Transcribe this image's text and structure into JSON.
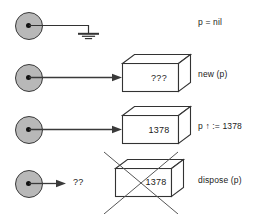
{
  "figure": {
    "background_color": "#ffffff",
    "stroke_color": "#333333",
    "circle_fill": "#b8b8b8",
    "text_color": "#1a1a1a"
  },
  "rows": [
    {
      "id": "nil",
      "pointer_label": "pointer-variable",
      "target": "ground-symbol",
      "target_text": "",
      "code_label": "p = nil",
      "crossed_out": false
    },
    {
      "id": "new",
      "pointer_label": "pointer-variable",
      "target": "box",
      "target_text": "???",
      "code_label": "new (p)",
      "crossed_out": false
    },
    {
      "id": "assign",
      "pointer_label": "pointer-variable",
      "target": "box",
      "target_text": "1378",
      "code_label": "p ↑ := 1378",
      "crossed_out": false
    },
    {
      "id": "dispose",
      "pointer_label": "pointer-variable",
      "target": "box",
      "target_text": "1378",
      "dangling_text": "??",
      "code_label": "dispose (p)",
      "crossed_out": true
    }
  ]
}
